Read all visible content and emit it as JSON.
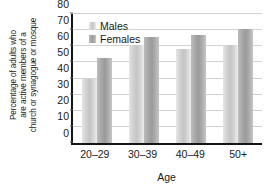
{
  "chart_data": {
    "type": "bar",
    "title": "",
    "categories": [
      "20–29",
      "30–39",
      "40–49",
      "50+"
    ],
    "series": [
      {
        "name": "Males",
        "values": [
          40,
          61,
          58,
          61
        ],
        "color": "#c9c9c9"
      },
      {
        "name": "Females",
        "values": [
          53,
          66,
          67,
          71
        ],
        "color": "#a0a0a0"
      }
    ],
    "xlabel": "Age",
    "ylabel": "Percentage of adults who are active members of a church or synagogue or mosque",
    "ylabel_lines": [
      "Percentage of adults who",
      "are active members of a",
      "church or synagogue or mosque"
    ],
    "ylim": [
      0,
      80
    ],
    "ytick_values": [
      0,
      10,
      20,
      30,
      40,
      50,
      60,
      70,
      80
    ],
    "ytick_labels": [
      "0",
      "10",
      "20",
      "30",
      "40",
      "50",
      "60",
      "70",
      "80"
    ],
    "grid": true,
    "grid_axis": "y",
    "legend_position": "top-left",
    "legend_entries": [
      "Males",
      "Females"
    ]
  }
}
